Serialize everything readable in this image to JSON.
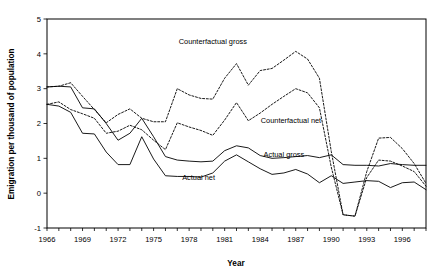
{
  "chart_data": {
    "type": "line",
    "title": "",
    "xlabel": "Year",
    "ylabel": "Emigration per thousand of population",
    "xlim": [
      1966,
      1998
    ],
    "ylim": [
      -1,
      5
    ],
    "grid": false,
    "legend_position": "inline-annotations",
    "y_ticks": [
      "-1",
      "0",
      "1",
      "2",
      "3",
      "4",
      "5"
    ],
    "y_tick_values": [
      -1,
      0,
      1,
      2,
      3,
      4,
      5
    ],
    "x_ticks": [
      "1966",
      "1969",
      "1972",
      "1975",
      "1978",
      "1981",
      "1984",
      "1987",
      "1990",
      "1993",
      "1996"
    ],
    "x_tick_values": [
      1966,
      1969,
      1972,
      1975,
      1978,
      1981,
      1984,
      1987,
      1990,
      1993,
      1996
    ],
    "x_minor_tick_values": [
      1966,
      1967,
      1968,
      1969,
      1970,
      1971,
      1972,
      1973,
      1974,
      1975,
      1976,
      1977,
      1978,
      1979,
      1980,
      1981,
      1982,
      1983,
      1984,
      1985,
      1986,
      1987,
      1988,
      1989,
      1990,
      1991,
      1992,
      1993,
      1994,
      1995,
      1996,
      1997,
      1998
    ],
    "x": [
      1966,
      1967,
      1968,
      1969,
      1970,
      1971,
      1972,
      1973,
      1974,
      1975,
      1976,
      1977,
      1978,
      1979,
      1980,
      1981,
      1982,
      1983,
      1984,
      1985,
      1986,
      1987,
      1988,
      1989,
      1990,
      1991,
      1992,
      1993,
      1994,
      1995,
      1996,
      1997,
      1998
    ],
    "series": [
      {
        "name": "Counterfactual gross",
        "style": "dashed",
        "label": "Counterfactual gross",
        "values": [
          3.05,
          3.07,
          3.17,
          2.78,
          2.4,
          2.02,
          2.26,
          2.42,
          2.15,
          2.05,
          2.05,
          3.0,
          2.82,
          2.72,
          2.7,
          3.3,
          3.72,
          3.1,
          3.52,
          3.58,
          3.82,
          4.07,
          3.85,
          3.3,
          1.2,
          -0.62,
          -0.66,
          0.62,
          1.58,
          1.6,
          1.28,
          0.85,
          0.28
        ]
      },
      {
        "name": "Counterfactual net",
        "style": "dashed",
        "label": "Counterfactual net",
        "values": [
          2.55,
          2.62,
          2.4,
          2.28,
          2.15,
          1.72,
          1.78,
          1.95,
          1.82,
          1.52,
          1.25,
          2.02,
          1.9,
          1.8,
          1.66,
          2.1,
          2.6,
          2.08,
          2.3,
          2.55,
          2.78,
          3.0,
          2.88,
          2.45,
          0.75,
          -0.62,
          -0.66,
          0.45,
          0.95,
          0.92,
          0.78,
          0.62,
          0.2
        ]
      },
      {
        "name": "Actual gross",
        "style": "solid",
        "label": "Actual gross",
        "values": [
          3.05,
          3.07,
          3.05,
          2.45,
          2.42,
          2.0,
          1.52,
          1.72,
          2.15,
          1.62,
          1.05,
          0.95,
          0.92,
          0.9,
          0.92,
          1.22,
          1.36,
          1.3,
          1.08,
          1.0,
          1.02,
          1.05,
          1.08,
          1.02,
          1.1,
          0.82,
          0.8,
          0.8,
          0.78,
          0.85,
          0.82,
          0.8,
          0.8
        ]
      },
      {
        "name": "Actual net",
        "style": "solid",
        "label": "Actual net",
        "values": [
          2.55,
          2.5,
          2.32,
          1.72,
          1.7,
          1.18,
          0.82,
          0.82,
          1.62,
          0.98,
          0.5,
          0.48,
          0.48,
          0.46,
          0.58,
          0.92,
          1.1,
          0.9,
          0.7,
          0.54,
          0.58,
          0.68,
          0.55,
          0.3,
          0.5,
          0.28,
          0.32,
          0.36,
          0.34,
          0.16,
          0.3,
          0.32,
          0.1
        ]
      }
    ],
    "annotations": [
      {
        "text": "Counterfactual gross",
        "x": 1980.0,
        "y": 4.28
      },
      {
        "text": "Counterfactual net",
        "x": 1986.6,
        "y": 2.02
      },
      {
        "text": "Actual gross",
        "x": 1986.0,
        "y": 1.05
      },
      {
        "text": "Actual net",
        "x": 1978.8,
        "y": 0.38
      }
    ]
  }
}
